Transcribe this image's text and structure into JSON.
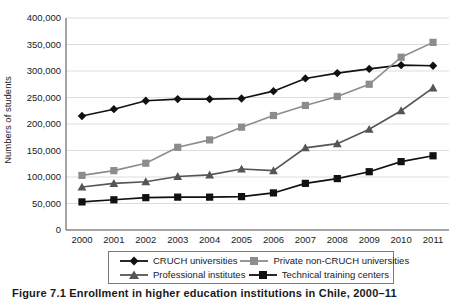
{
  "figure": {
    "caption": "Figure 7.1 Enrollment in higher education institutions in Chile, 2000–11"
  },
  "chart_data": {
    "type": "line",
    "title": "",
    "xlabel": "",
    "ylabel": "Numbers of students",
    "categories": [
      "2000",
      "2001",
      "2002",
      "2003",
      "2004",
      "2005",
      "2006",
      "2007",
      "2008",
      "2009",
      "2010",
      "2011"
    ],
    "ylim": [
      0,
      400000
    ],
    "ytick_values": [
      0,
      50000,
      100000,
      150000,
      200000,
      250000,
      300000,
      350000,
      400000
    ],
    "ytick_labels": [
      "0",
      "50,000",
      "100,000",
      "150,000",
      "200,000",
      "250,000",
      "300,000",
      "350,000",
      "400,000"
    ],
    "grid": true,
    "legend_position": "bottom",
    "series": [
      {
        "name": "CRUCH universities",
        "marker": "diamond",
        "color": "#111111",
        "values": [
          215000,
          228000,
          244000,
          247000,
          247000,
          248000,
          262000,
          286000,
          296000,
          304000,
          311000,
          310000
        ]
      },
      {
        "name": "Private non-CRUCH universities",
        "marker": "square",
        "color": "#8c8c8c",
        "values": [
          103000,
          112000,
          126000,
          156000,
          170000,
          194000,
          216000,
          235000,
          252000,
          275000,
          326000,
          354000
        ]
      },
      {
        "name": "Professional institutes",
        "marker": "triangle",
        "color": "#555555",
        "values": [
          81000,
          88000,
          91000,
          101000,
          104000,
          115000,
          112000,
          155000,
          163000,
          190000,
          225000,
          268000
        ]
      },
      {
        "name": "Technical training centers",
        "marker": "square",
        "color": "#111111",
        "values": [
          53000,
          57000,
          61000,
          62000,
          62000,
          63000,
          70000,
          88000,
          97000,
          110000,
          129000,
          140000
        ]
      }
    ]
  },
  "legend": {
    "items": [
      {
        "label": "CRUCH universities"
      },
      {
        "label": "Private non-CRUCH universities"
      },
      {
        "label": "Professional institutes"
      },
      {
        "label": "Technical training centers"
      }
    ]
  }
}
